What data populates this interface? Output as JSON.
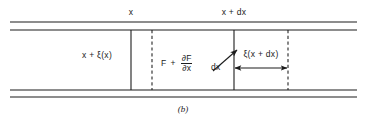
{
  "figure": {
    "caption": "(b)",
    "labels": {
      "top_left_station": "x",
      "top_right_station": "x + dx",
      "left_displacement": "x + ξ(x)",
      "right_displacement": "ξ(x + dx)",
      "dx_arrow": "dx"
    },
    "formula": {
      "force_term": "F",
      "plus": "+",
      "numerator": "∂F",
      "denominator": "∂x"
    },
    "colors": {
      "line": "#1c1c1c",
      "background": "#ffffff",
      "text": "#1c1c1c"
    },
    "geometry": {
      "wall_top_outer_y": 22,
      "wall_top_inner_y": 30,
      "wall_bottom_inner_y": 90,
      "wall_bottom_outer_y": 97,
      "wall_left_x": 10,
      "wall_right_x": 357,
      "solid_divider_1_x": 131,
      "dashed_divider_1_x": 152,
      "solid_divider_2_x": 234,
      "dashed_divider_2_x": 288,
      "measure_arrow_y": 68
    }
  }
}
